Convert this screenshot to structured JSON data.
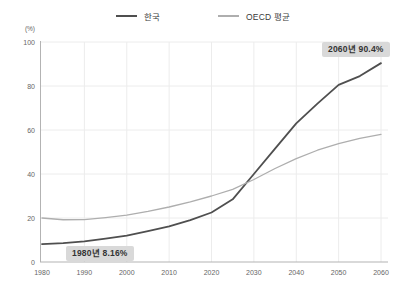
{
  "chart_data": {
    "type": "line",
    "title": "",
    "xlabel": "",
    "ylabel": "(%)",
    "ylim": [
      0,
      100
    ],
    "grid": true,
    "legend_position": "top-center",
    "x": [
      1980,
      1985,
      1990,
      1995,
      2000,
      2005,
      2010,
      2015,
      2020,
      2025,
      2030,
      2035,
      2040,
      2045,
      2050,
      2055,
      2060
    ],
    "xticks": [
      1980,
      1990,
      2000,
      2010,
      2020,
      2030,
      2040,
      2050,
      2060
    ],
    "yticks": [
      0,
      20,
      40,
      60,
      80,
      100
    ],
    "series": [
      {
        "name": "한국",
        "color": "#4f4f4f",
        "values": [
          8.16,
          8.6,
          9.4,
          10.6,
          12,
          14,
          16.2,
          19,
          22.5,
          28.5,
          40,
          51.5,
          63,
          72,
          80.5,
          84.5,
          90.4
        ]
      },
      {
        "name": "OECD 평균",
        "color": "#aeaeae",
        "values": [
          20,
          19.2,
          19.3,
          20.2,
          21.3,
          23,
          25,
          27.3,
          30,
          33,
          37.5,
          42.5,
          47,
          50.8,
          53.8,
          56.2,
          58
        ]
      }
    ],
    "annotations": [
      {
        "text": "1980년 8.16%",
        "anchor_x": 1980,
        "anchor_y": 8.16
      },
      {
        "text": "2060년 90.4%",
        "anchor_x": 2060,
        "anchor_y": 90.4
      }
    ],
    "colors": {
      "grid": "#ececec",
      "axis": "#b3b3b3",
      "tick_text": "#666666",
      "annotation_bg": "#d9d9d9",
      "annotation_text": "#333333"
    }
  }
}
